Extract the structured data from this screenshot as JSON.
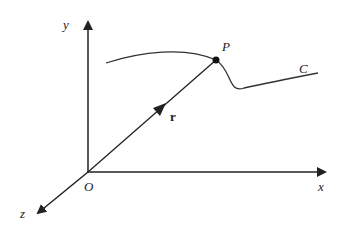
{
  "diagram": {
    "type": "3d-coordinate-space-curve",
    "axes": {
      "x_label": "x",
      "y_label": "y",
      "z_label": "z",
      "origin_label": "O"
    },
    "vector": {
      "label": "r",
      "from": "O",
      "to": "P"
    },
    "point": {
      "label": "P"
    },
    "curve": {
      "label": "C"
    },
    "colors": {
      "stroke": "#222222",
      "background": "#ffffff"
    }
  }
}
